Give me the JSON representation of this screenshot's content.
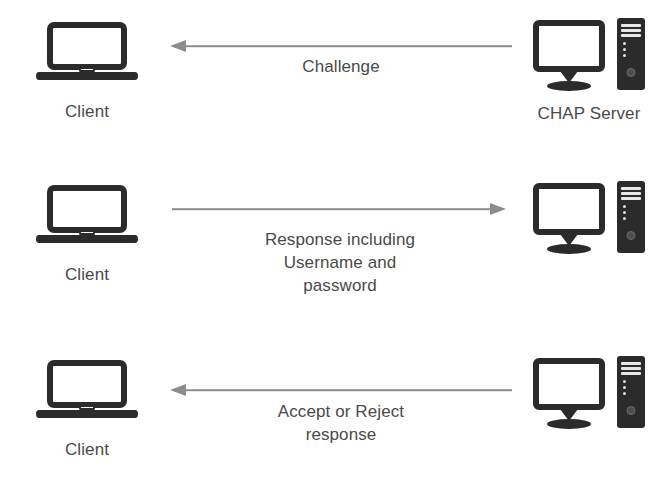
{
  "diagram": {
    "background_color": "#ffffff",
    "icon_color": "#2b2b2b",
    "arrow_color": "#8c8c8c",
    "text_color": "#4a4a4a",
    "steps": [
      {
        "id": "step-1-challenge",
        "left_node": {
          "icon": "laptop-icon",
          "label": "Client"
        },
        "right_node": {
          "icon": "server-icon",
          "label": "CHAP Server"
        },
        "arrow": {
          "direction": "left",
          "from": "CHAP Server",
          "to": "Client",
          "label": "Challenge"
        }
      },
      {
        "id": "step-2-response",
        "left_node": {
          "icon": "laptop-icon",
          "label": "Client"
        },
        "right_node": {
          "icon": "server-icon",
          "label": ""
        },
        "arrow": {
          "direction": "right",
          "from": "Client",
          "to": "CHAP Server",
          "label": "Response including\nUsername and\npassword"
        }
      },
      {
        "id": "step-3-accept-reject",
        "left_node": {
          "icon": "laptop-icon",
          "label": "Client"
        },
        "right_node": {
          "icon": "server-icon",
          "label": ""
        },
        "arrow": {
          "direction": "left",
          "from": "CHAP Server",
          "to": "Client",
          "label": "Accept or Reject\nresponse"
        }
      }
    ]
  }
}
